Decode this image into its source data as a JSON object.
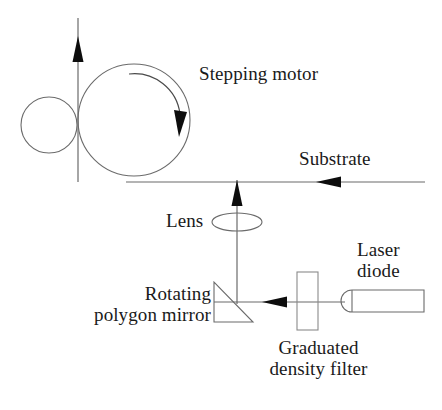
{
  "figure": {
    "kind": "optical-apparatus-schematic",
    "line_color": "#555555",
    "accent_color": "#000000",
    "background": "#ffffff"
  },
  "labels": {
    "stepping_motor": "Stepping motor",
    "substrate": "Substrate",
    "lens": "Lens",
    "laser_diode": "Laser\ndiode",
    "rotating_polygon_mirror": "Rotating\npolygon mirror",
    "graduated_density_filter": "Graduated\ndensity filter"
  },
  "components": [
    {
      "name": "pinch-roller",
      "shape": "circle",
      "cx": 49,
      "cy": 125,
      "r": 28
    },
    {
      "name": "drum-roller",
      "shape": "circle",
      "cx": 134,
      "cy": 120,
      "r": 56
    },
    {
      "name": "rotation-arc-arrow",
      "shape": "arc",
      "direction": "clockwise"
    },
    {
      "name": "web-feed-arrow",
      "shape": "arrow",
      "direction": "up",
      "x": 78,
      "y1": 182,
      "y2": 18
    },
    {
      "name": "substrate-line",
      "shape": "line",
      "x1": 130,
      "y1": 182,
      "x2": 425,
      "y2": 182
    },
    {
      "name": "substrate-arrowhead",
      "shape": "arrowhead",
      "direction": "left",
      "x": 325,
      "y": 182
    },
    {
      "name": "beam-up-arrow",
      "shape": "arrow",
      "direction": "up",
      "x": 237,
      "y1": 305,
      "y2": 180
    },
    {
      "name": "lens-ellipse",
      "shape": "ellipse",
      "cx": 237,
      "cy": 222,
      "rx": 25,
      "ry": 9
    },
    {
      "name": "polygon-mirror",
      "shape": "triangle",
      "points": "214,282 214,322 253,322"
    },
    {
      "name": "beam-horizontal",
      "shape": "line",
      "x1": 214,
      "y1": 302,
      "x2": 345,
      "y2": 302
    },
    {
      "name": "beam-arrowhead",
      "shape": "arrowhead",
      "direction": "left",
      "x": 266,
      "y": 302
    },
    {
      "name": "density-filter",
      "shape": "rect",
      "x": 297,
      "y": 272,
      "w": 21,
      "h": 58
    },
    {
      "name": "laser-diode-body",
      "shape": "rounded-rect",
      "x": 341,
      "y": 290,
      "w": 83,
      "h": 22
    }
  ]
}
